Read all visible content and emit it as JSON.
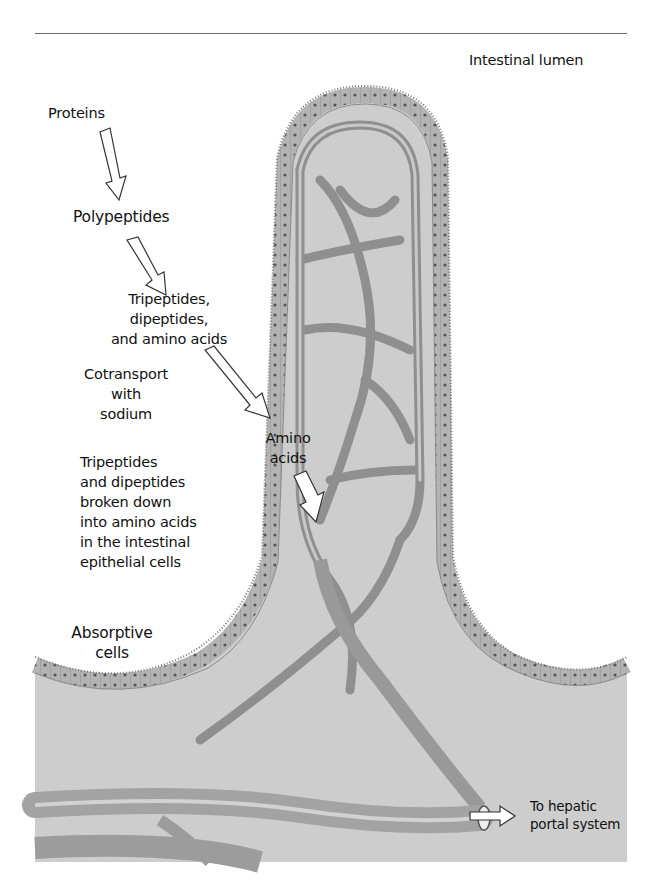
{
  "figure": {
    "labels": {
      "intestinal_lumen": "Intestinal lumen",
      "proteins": "Proteins",
      "polypeptides": "Polypeptides",
      "tri_di_amino": [
        "Tripeptides,",
        "dipeptides,",
        "and amino acids"
      ],
      "cotransport": [
        "Cotransport",
        "with",
        "sodium"
      ],
      "breakdown": [
        "Tripeptides",
        "and dipeptides",
        "broken down",
        "into amino acids",
        "in the intestinal",
        "epithelial cells"
      ],
      "amino_acids": [
        "Amino",
        "acids"
      ],
      "absorptive_cells": [
        "Absorptive",
        "cells"
      ],
      "hepatic_portal": [
        "To hepatic",
        "portal system"
      ]
    },
    "flow": [
      "Proteins",
      "Polypeptides",
      "Tripeptides, dipeptides, and amino acids",
      "Amino acids",
      "To hepatic portal system"
    ],
    "colors": {
      "tissue": "#c9c9c9",
      "epithelium": "#a9a9a9",
      "vessel": "#9a9a9a",
      "text": "#111111",
      "background": "#ffffff"
    }
  }
}
